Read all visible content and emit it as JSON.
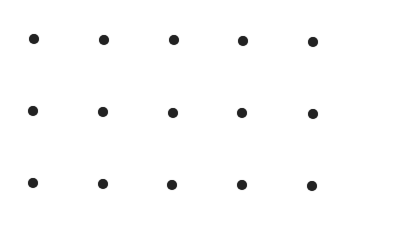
{
  "grid": {
    "rows": 3,
    "cols": 5,
    "dot_color": "#222222",
    "dot_diameter": 10,
    "background": "#ffffff",
    "dots": [
      {
        "row": 0,
        "col": 0,
        "x": 34,
        "y": 39
      },
      {
        "row": 0,
        "col": 1,
        "x": 104,
        "y": 40
      },
      {
        "row": 0,
        "col": 2,
        "x": 174,
        "y": 40
      },
      {
        "row": 0,
        "col": 3,
        "x": 243,
        "y": 41
      },
      {
        "row": 0,
        "col": 4,
        "x": 313,
        "y": 42
      },
      {
        "row": 1,
        "col": 0,
        "x": 33,
        "y": 111
      },
      {
        "row": 1,
        "col": 1,
        "x": 103,
        "y": 112
      },
      {
        "row": 1,
        "col": 2,
        "x": 173,
        "y": 113
      },
      {
        "row": 1,
        "col": 3,
        "x": 242,
        "y": 113
      },
      {
        "row": 1,
        "col": 4,
        "x": 313,
        "y": 114
      },
      {
        "row": 2,
        "col": 0,
        "x": 33,
        "y": 183
      },
      {
        "row": 2,
        "col": 1,
        "x": 103,
        "y": 184
      },
      {
        "row": 2,
        "col": 2,
        "x": 172,
        "y": 185
      },
      {
        "row": 2,
        "col": 3,
        "x": 242,
        "y": 185
      },
      {
        "row": 2,
        "col": 4,
        "x": 312,
        "y": 186
      }
    ]
  }
}
